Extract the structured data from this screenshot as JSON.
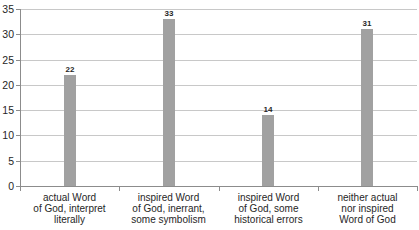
{
  "chart_data": {
    "type": "bar",
    "title": "",
    "xlabel": "",
    "ylabel": "",
    "categories": [
      "actual Word of God, interpret literally",
      "inspired Word of God, inerrant, some symbolism",
      "inspired Word of God, some historical errors",
      "neither actual nor inspired Word of God"
    ],
    "category_lines": [
      [
        "actual Word",
        "of God, interpret",
        "literally"
      ],
      [
        "inspired Word",
        "of God, inerrant,",
        "some symbolism"
      ],
      [
        "inspired Word",
        "of God, some",
        "historical errors"
      ],
      [
        "neither actual",
        "nor inspired",
        "Word of God"
      ]
    ],
    "values": [
      22,
      33,
      14,
      31
    ],
    "ylim": [
      0,
      35
    ],
    "ytick_step": 5,
    "ytick_labels": [
      "0",
      "5",
      "10",
      "15",
      "20",
      "25",
      "30",
      "35"
    ],
    "grid": true,
    "legend": "none",
    "colors": {
      "bar": "#a1a1a1",
      "gridline": "#c8c8c8",
      "axis": "#8c8c8c",
      "text": "#262626"
    }
  }
}
